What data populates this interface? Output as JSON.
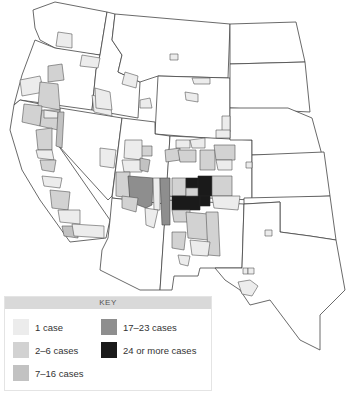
{
  "map": {
    "region": "Western United States",
    "subject": "Cases by county"
  },
  "key": {
    "title": "KEY",
    "items": [
      {
        "label": "1 case",
        "color": "#ececec"
      },
      {
        "label": "2–6 cases",
        "color": "#d2d2d2"
      },
      {
        "label": "7–16 cases",
        "color": "#c2c2c2"
      },
      {
        "label": "17–23 cases",
        "color": "#8e8e8e"
      },
      {
        "label": "24 or more cases",
        "color": "#1a1a1a"
      }
    ]
  }
}
